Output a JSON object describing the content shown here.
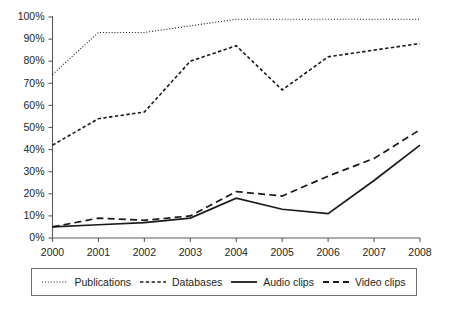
{
  "chart_data": {
    "type": "line",
    "title": "",
    "subtitle": "",
    "xlabel": "",
    "ylabel": "",
    "categories": [
      "2000",
      "2001",
      "2002",
      "2003",
      "2004",
      "2005",
      "2006",
      "2007",
      "2008"
    ],
    "x": [
      2000,
      2001,
      2002,
      2003,
      2004,
      2005,
      2006,
      2007,
      2008
    ],
    "ylim": [
      0,
      100
    ],
    "ytick_labels": [
      "0%",
      "10%",
      "20%",
      "30%",
      "40%",
      "50%",
      "60%",
      "70%",
      "80%",
      "90%",
      "100%"
    ],
    "ytick_values": [
      0,
      10,
      20,
      30,
      40,
      50,
      60,
      70,
      80,
      90,
      100
    ],
    "grid": false,
    "legend_position": "bottom",
    "value_suffix": "%",
    "series": [
      {
        "name": "Publications",
        "line_style": "dotted",
        "color": "#1a1a1a",
        "values": [
          74,
          93,
          93,
          96,
          99,
          99,
          99,
          99,
          99
        ]
      },
      {
        "name": "Databases",
        "line_style": "dashed-short",
        "color": "#1a1a1a",
        "values": [
          42,
          54,
          57,
          80,
          87,
          67,
          82,
          85,
          88
        ]
      },
      {
        "name": "Audio clips",
        "line_style": "solid",
        "color": "#1a1a1a",
        "values": [
          5,
          6,
          7,
          9,
          18,
          13,
          11,
          26,
          42
        ]
      },
      {
        "name": "Video clips",
        "line_style": "dashed-long",
        "color": "#1a1a1a",
        "values": [
          5,
          9,
          8,
          10,
          21,
          19,
          28,
          36,
          49
        ]
      }
    ]
  },
  "legend": {
    "items": [
      {
        "label": "Publications",
        "style": "dotted"
      },
      {
        "label": "Databases",
        "style": "dashed-short"
      },
      {
        "label": "Audio clips",
        "style": "solid"
      },
      {
        "label": "Video clips",
        "style": "dashed-long"
      }
    ]
  }
}
